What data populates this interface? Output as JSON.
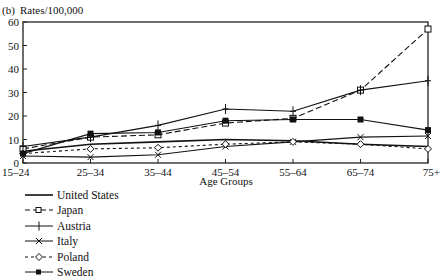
{
  "panel_label": "(b)",
  "y_unit_label": "Rates/100,000",
  "chart_data": {
    "type": "line",
    "title": "",
    "xlabel": "Age Groups",
    "ylabel": "Rates/100,000",
    "ylim": [
      0,
      60
    ],
    "yticks": [
      0,
      10,
      20,
      30,
      40,
      50,
      60
    ],
    "grid": false,
    "legend_position": "bottom-left",
    "categories": [
      "15–24",
      "25–34",
      "35–44",
      "45–54",
      "55–64",
      "65–74",
      "75+"
    ],
    "series": [
      {
        "name": "United States",
        "style": "solid",
        "marker": "none",
        "values": [
          5,
          8,
          9,
          10,
          9.5,
          8,
          7
        ]
      },
      {
        "name": "Japan",
        "style": "dashed",
        "marker": "open-square",
        "values": [
          6,
          11,
          12,
          17,
          19,
          31,
          57
        ]
      },
      {
        "name": "Austria",
        "style": "solid",
        "marker": "plus",
        "values": [
          7,
          11,
          16,
          23,
          22,
          31,
          35
        ]
      },
      {
        "name": "Italy",
        "style": "solid",
        "marker": "x",
        "values": [
          3,
          2.5,
          3.5,
          7,
          9,
          11,
          11.5
        ]
      },
      {
        "name": "Poland",
        "style": "dashed",
        "marker": "open-diamond",
        "values": [
          4,
          6,
          6.5,
          8,
          9,
          8,
          6
        ]
      },
      {
        "name": "Sweden",
        "style": "solid",
        "marker": "filled-square",
        "values": [
          4,
          12.5,
          13,
          18,
          18.5,
          18.5,
          14
        ]
      }
    ]
  },
  "legend": {
    "items": [
      {
        "label": "United States"
      },
      {
        "label": "Japan"
      },
      {
        "label": "Austria"
      },
      {
        "label": "Italy"
      },
      {
        "label": "Poland"
      },
      {
        "label": "Sweden"
      }
    ]
  }
}
